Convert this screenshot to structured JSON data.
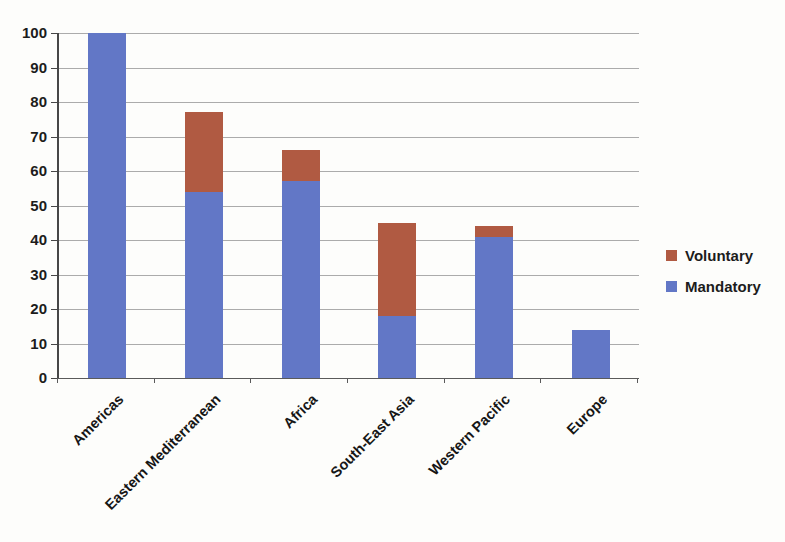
{
  "chart_data": {
    "type": "bar",
    "stacked": true,
    "categories": [
      "Americas",
      "Eastern Mediterranean",
      "Africa",
      "South-East Asia",
      "Western Pacific",
      "Europe"
    ],
    "series": [
      {
        "name": "Mandatory",
        "color": "#6277c6",
        "values": [
          100,
          54,
          57,
          18,
          41,
          14
        ]
      },
      {
        "name": "Voluntary",
        "color": "#b05a42",
        "values": [
          0,
          23,
          9,
          27,
          3,
          0
        ]
      }
    ],
    "totals": [
      100,
      77,
      66,
      45,
      44,
      14
    ],
    "xlabel": "",
    "ylabel": "",
    "ylim": [
      0,
      100
    ],
    "ytick_step": 10,
    "yticks": [
      0,
      10,
      20,
      30,
      40,
      50,
      60,
      70,
      80,
      90,
      100
    ],
    "grid": true,
    "legend_position": "right"
  },
  "legend": {
    "items": [
      {
        "label": "Voluntary",
        "color": "#b05a42"
      },
      {
        "label": "Mandatory",
        "color": "#6277c6"
      }
    ]
  },
  "colors": {
    "mandatory": "#6277c6",
    "voluntary": "#b05a42",
    "gridline": "#9c9c9c",
    "axis": "#474747",
    "text": "#1c1c1c",
    "background": "#fdfdfb"
  }
}
